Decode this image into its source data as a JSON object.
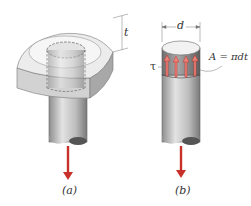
{
  "figure": {
    "panels": [
      {
        "id": "a",
        "caption": "(a)",
        "description": "rod with square head in a plate, dashed cylinder indicating shear surface"
      },
      {
        "id": "b",
        "caption": "(b)",
        "description": "free body of rod head showing shear stress on cylindrical surface"
      }
    ],
    "labels": {
      "thickness": "t",
      "diameter": "d",
      "area_eq": "A = πdt",
      "shear_stress": "τ"
    },
    "colors": {
      "arrow": "#c8312a",
      "stress_arrow": "#e07a70",
      "rod_light": "#d9d9d9",
      "rod_dark": "#8a8a8a",
      "rod_end": "#555555",
      "plate": "#cfcfcf"
    },
    "stress_arrow_count": 4
  }
}
